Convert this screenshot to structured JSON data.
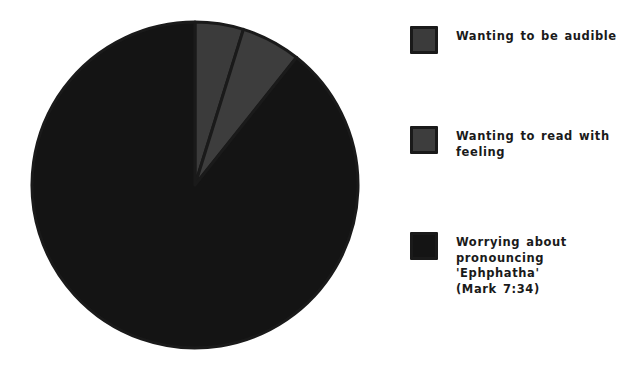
{
  "chart_data": {
    "type": "pie",
    "title": "",
    "categories": [
      "Wanting to be audible",
      "Wanting to read with feeling",
      "Worrying about pronouncing 'Ephphatha' (Mark 7:34)"
    ],
    "values": [
      4.8,
      5.9,
      89.3
    ],
    "colors": [
      "#3b3b3b",
      "#3d3d3d",
      "#141414"
    ],
    "start_angle": 0,
    "legend_position": "right",
    "grid": false,
    "slice_edge_color": "#1a1a1a",
    "slice_edge_width": 3,
    "background": "#ffffff"
  },
  "legend": {
    "items": [
      {
        "label": "Wanting to be audible",
        "color": "#3b3b3b",
        "swatch_name": "legend-swatch-audible"
      },
      {
        "label": "Wanting to read with\nfeeling",
        "color": "#3d3d3d",
        "swatch_name": "legend-swatch-feeling"
      },
      {
        "label": "Worrying about\npronouncing 'Ephphatha'\n(Mark 7:34)",
        "color": "#141414",
        "swatch_name": "legend-swatch-worrying"
      }
    ]
  }
}
